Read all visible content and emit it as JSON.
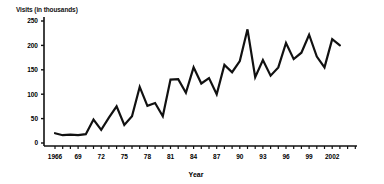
{
  "chart_data": {
    "type": "line",
    "title": "",
    "xlabel": "Year",
    "ylabel": "Visits (in thousands)",
    "ylim": [
      0,
      250
    ],
    "xlim": [
      1966,
      2003
    ],
    "y_ticks": [
      0,
      50,
      100,
      150,
      200,
      250
    ],
    "x_tick_labels": [
      "1966",
      "69",
      "72",
      "75",
      "78",
      "81",
      "84",
      "87",
      "90",
      "93",
      "96",
      "99",
      "2002"
    ],
    "grid": false,
    "legend": null,
    "x": [
      1966,
      1967,
      1968,
      1969,
      1970,
      1971,
      1972,
      1973,
      1974,
      1975,
      1976,
      1977,
      1978,
      1979,
      1980,
      1981,
      1982,
      1983,
      1984,
      1985,
      1986,
      1987,
      1988,
      1989,
      1990,
      1991,
      1992,
      1993,
      1994,
      1995,
      1996,
      1997,
      1998,
      1999,
      2000,
      2001,
      2002,
      2003
    ],
    "series": [
      {
        "name": "Visits",
        "values": [
          20,
          16,
          17,
          16,
          18,
          48,
          27,
          52,
          75,
          37,
          55,
          115,
          76,
          82,
          55,
          130,
          131,
          103,
          155,
          122,
          133,
          100,
          160,
          145,
          168,
          233,
          135,
          170,
          138,
          155,
          205,
          172,
          185,
          222,
          177,
          155,
          213,
          200
        ]
      }
    ]
  },
  "axes": {
    "y_title": "Visits (in thousands)",
    "x_title": "Year"
  }
}
